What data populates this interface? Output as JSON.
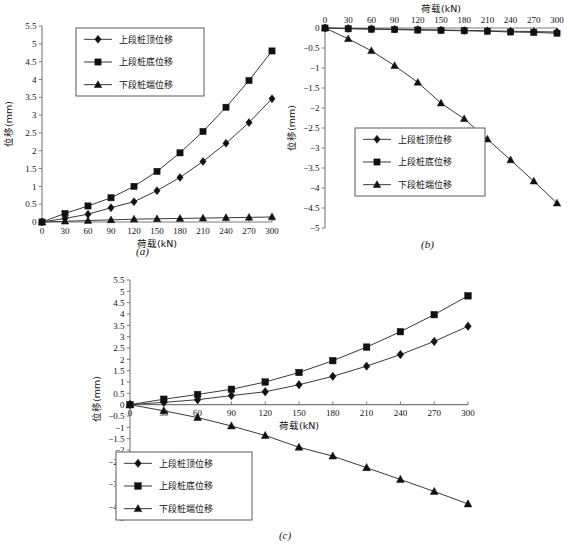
{
  "figure": {
    "panels": [
      "a",
      "b",
      "c"
    ],
    "caption_a": "(a)",
    "caption_b": "(b)",
    "caption_c": "(c)"
  },
  "labels": {
    "xlabel": "荷载(kN)",
    "ylabel": "位移(mm)",
    "series_top": "上段桩顶位移",
    "series_bottom": "上段桩底位移",
    "series_tip": "下段桩端位移"
  },
  "chart_data": [
    {
      "id": "a",
      "type": "line",
      "title": "(a)",
      "xlabel": "荷载(kN)",
      "ylabel": "位移(mm)",
      "x": [
        0,
        30,
        60,
        90,
        120,
        150,
        180,
        210,
        240,
        270,
        300
      ],
      "xlim": [
        0,
        300
      ],
      "ylim": [
        0,
        5.5
      ],
      "xticks": [
        0,
        30,
        60,
        90,
        120,
        150,
        180,
        210,
        240,
        270,
        300
      ],
      "yticks": [
        0,
        0.5,
        1,
        1.5,
        2,
        2.5,
        3,
        3.5,
        4,
        4.5,
        5,
        5.5
      ],
      "xaxis_position": "bottom",
      "grid": false,
      "legend_position": "top-left",
      "series": [
        {
          "name": "上段桩顶位移",
          "marker": "diamond",
          "values": [
            0,
            0.1,
            0.22,
            0.4,
            0.57,
            0.88,
            1.25,
            1.7,
            2.21,
            2.79,
            3.46
          ]
        },
        {
          "name": "上段桩底位移",
          "marker": "square",
          "values": [
            0,
            0.24,
            0.45,
            0.68,
            1.0,
            1.42,
            1.94,
            2.54,
            3.22,
            3.97,
            4.8
          ]
        },
        {
          "name": "下段桩端位移",
          "marker": "triangle",
          "values": [
            0,
            0.02,
            0.04,
            0.06,
            0.08,
            0.09,
            0.1,
            0.11,
            0.12,
            0.13,
            0.14
          ]
        }
      ]
    },
    {
      "id": "b",
      "type": "line",
      "title": "(b)",
      "xlabel": "荷载(kN)",
      "ylabel": "位移(mm)",
      "x": [
        0,
        30,
        60,
        90,
        120,
        150,
        180,
        210,
        240,
        270,
        300
      ],
      "xlim": [
        0,
        300
      ],
      "ylim": [
        -5,
        0
      ],
      "xticks": [
        0,
        30,
        60,
        90,
        120,
        150,
        180,
        210,
        240,
        270,
        300
      ],
      "yticks": [
        0,
        -0.5,
        -1,
        -1.5,
        -2,
        -2.5,
        -3,
        -3.5,
        -4,
        -4.5,
        -5
      ],
      "xaxis_position": "top",
      "grid": false,
      "legend_position": "bottom-left",
      "series": [
        {
          "name": "上段桩顶位移",
          "marker": "diamond",
          "values": [
            0,
            -0.01,
            -0.02,
            -0.03,
            -0.04,
            -0.05,
            -0.06,
            -0.07,
            -0.08,
            -0.09,
            -0.1
          ]
        },
        {
          "name": "上段桩底位移",
          "marker": "square",
          "values": [
            0,
            -0.02,
            -0.03,
            -0.04,
            -0.05,
            -0.06,
            -0.07,
            -0.08,
            -0.1,
            -0.11,
            -0.13
          ]
        },
        {
          "name": "下段桩端位移",
          "marker": "triangle",
          "values": [
            0,
            -0.27,
            -0.57,
            -0.94,
            -1.36,
            -1.88,
            -2.27,
            -2.78,
            -3.3,
            -3.83,
            -4.38
          ]
        }
      ]
    },
    {
      "id": "c",
      "type": "line",
      "title": "(c)",
      "xlabel": "荷载(kN)",
      "ylabel": "位移(mm)",
      "x": [
        0,
        30,
        60,
        90,
        120,
        150,
        180,
        210,
        240,
        270,
        300
      ],
      "xlim": [
        0,
        300
      ],
      "ylim": [
        -5,
        5.5
      ],
      "xticks": [
        0,
        30,
        60,
        90,
        120,
        150,
        180,
        210,
        240,
        270,
        300
      ],
      "yticks": [
        5.5,
        5,
        4.5,
        4,
        3.5,
        3,
        2.5,
        2,
        1.5,
        1,
        0.5,
        0,
        -0.5,
        -1,
        -1.5,
        -2,
        -2.5,
        -3,
        -3.5,
        -4,
        -4.5,
        -5
      ],
      "xaxis_position": "zero",
      "grid": false,
      "legend_position": "bottom-left",
      "series": [
        {
          "name": "上段桩顶位移",
          "marker": "diamond",
          "values": [
            0,
            0.1,
            0.22,
            0.4,
            0.57,
            0.88,
            1.25,
            1.7,
            2.21,
            2.79,
            3.46
          ]
        },
        {
          "name": "上段桩底位移",
          "marker": "square",
          "values": [
            0,
            0.24,
            0.45,
            0.68,
            1.0,
            1.42,
            1.94,
            2.54,
            3.22,
            3.97,
            4.8
          ]
        },
        {
          "name": "下段桩端位移",
          "marker": "triangle",
          "values": [
            0,
            -0.27,
            -0.57,
            -0.94,
            -1.36,
            -1.88,
            -2.27,
            -2.78,
            -3.3,
            -3.83,
            -4.38
          ]
        }
      ]
    }
  ]
}
